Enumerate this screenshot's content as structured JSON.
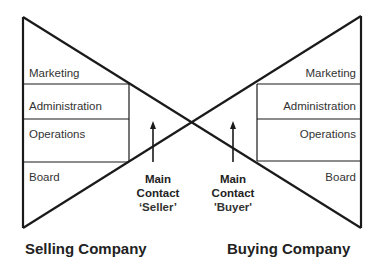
{
  "selling": {
    "title": "Selling Company",
    "levels": [
      "Marketing",
      "Administration",
      "Operations",
      "Board"
    ],
    "contact": {
      "line1": "Main",
      "line2": "Contact",
      "line3": "‘Seller’"
    }
  },
  "buying": {
    "title": "Buying Company",
    "levels": [
      "Marketing",
      "Administration",
      "Operations",
      "Board"
    ],
    "contact": {
      "line1": "Main",
      "line2": "Contact",
      "line3": "'Buyer'"
    }
  },
  "colors": {
    "line": "#1a1a1a",
    "background": "#ffffff"
  }
}
